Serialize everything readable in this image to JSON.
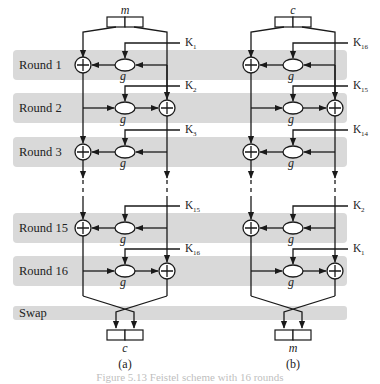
{
  "figure": {
    "rounds": [
      {
        "label": "Round 1",
        "xor_side": "left",
        "keys": {
          "a": "1",
          "b": "16"
        }
      },
      {
        "label": "Round 2",
        "xor_side": "right",
        "keys": {
          "a": "2",
          "b": "15"
        }
      },
      {
        "label": "Round 3",
        "xor_side": "left",
        "keys": {
          "a": "3",
          "b": "14"
        }
      },
      {
        "label": "Round 15",
        "xor_side": "left",
        "keys": {
          "a": "15",
          "b": "2"
        }
      },
      {
        "label": "Round 16",
        "xor_side": "right",
        "keys": {
          "a": "16",
          "b": "1"
        }
      }
    ],
    "swap_label": "Swap",
    "function_label": "g",
    "key_letter": "K",
    "panels": [
      {
        "id": "a",
        "sublabel": "(a)",
        "input": "m",
        "output": "c"
      },
      {
        "id": "b",
        "sublabel": "(b)",
        "input": "c",
        "output": "m"
      }
    ],
    "caption": "Figure 5.13   Feistel scheme with 16 rounds"
  }
}
